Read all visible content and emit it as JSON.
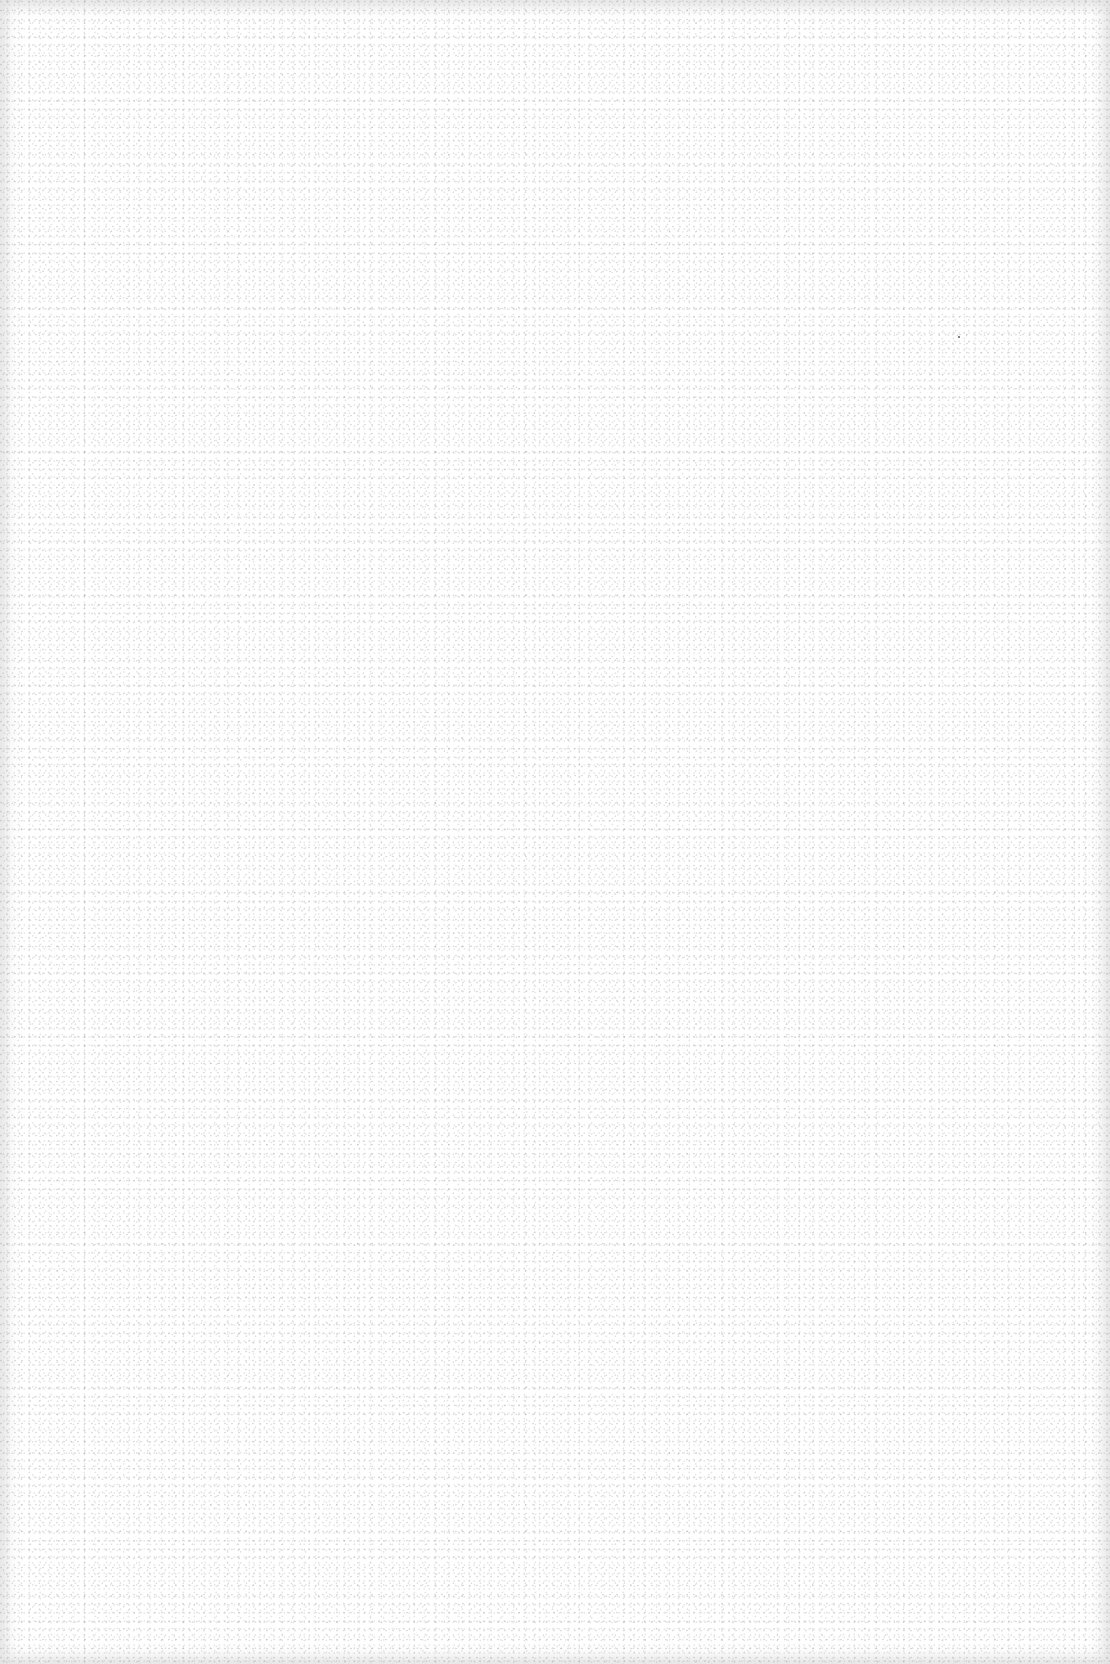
{
  "document": {
    "type": "scanned-page",
    "content": "",
    "colors": {
      "paper": "#ffffff",
      "edge_shadow": "#e6e6e6",
      "noise": "#bdbdbd"
    }
  }
}
